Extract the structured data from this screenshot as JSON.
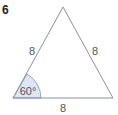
{
  "question_number": "6",
  "figure": {
    "shape": "equilateral triangle",
    "vertices": {
      "apex": [
        63,
        7
      ],
      "left": [
        13,
        98
      ],
      "right": [
        113,
        98
      ]
    },
    "side_labels": {
      "left": "8",
      "right": "8",
      "base": "8"
    },
    "angle_label": "60°",
    "colors": {
      "stroke": "#8a8fa8",
      "angle_fill": "#dbe6f7"
    }
  }
}
